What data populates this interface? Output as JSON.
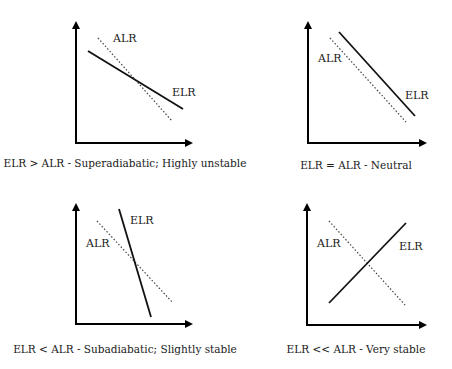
{
  "diagram": {
    "panels": [
      {
        "id": "superadiabatic",
        "caption": "ELR > ALR - Superadiabatic; Highly unstable",
        "alr_label": "ALR",
        "elr_label": "ELR"
      },
      {
        "id": "neutral",
        "caption": "ELR = ALR - Neutral",
        "alr_label": "ALR",
        "elr_label": "ELR"
      },
      {
        "id": "subadiabatic",
        "caption": "ELR < ALR - Subadiabatic; Slightly stable",
        "alr_label": "ALR",
        "elr_label": "ELR"
      },
      {
        "id": "very-stable",
        "caption": "ELR << ALR - Very stable",
        "alr_label": "ALR",
        "elr_label": "ELR"
      }
    ],
    "legend": {
      "alr_style": "dotted line",
      "elr_style": "solid line"
    }
  }
}
